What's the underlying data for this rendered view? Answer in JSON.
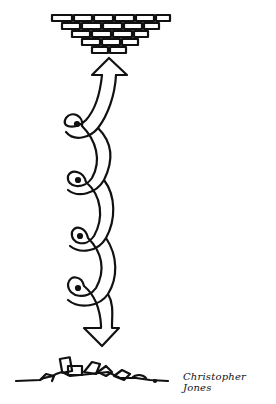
{
  "illustration": {
    "description": "Hand-drawn cartoon: brick ceiling at top, arrow pointing up into it, curly twisted stem with loops, arrow pointing down to rubble pile at bottom",
    "signature": "Christopher Jones",
    "colors": {
      "ink": "#111111",
      "background": "#ffffff"
    },
    "elements": {
      "top": "brick-wall-inverted-pyramid",
      "up_arrow": "arrow-up",
      "stem_loops": 4,
      "down_arrow": "arrow-down",
      "bottom": "brick-rubble-pile"
    }
  }
}
